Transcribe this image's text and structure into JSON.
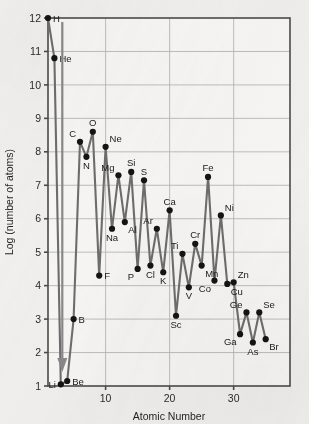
{
  "chart_data": {
    "type": "line",
    "title": "",
    "xlabel": "Atomic Number",
    "ylabel": "Log (number of atoms)",
    "xlim": [
      1,
      38.8
    ],
    "ylim": [
      1,
      12
    ],
    "grid": true,
    "legend": "none",
    "xticks": [
      10,
      20,
      30
    ],
    "yticks": [
      1,
      2,
      3,
      4,
      5,
      6,
      7,
      8,
      9,
      10,
      11,
      12
    ],
    "annotation": {
      "arrow_label": "Li",
      "arrow_note": "downward arrow at Li indicating value below axis range"
    },
    "point_labels": [
      "H",
      "He",
      "Li",
      "Be",
      "B",
      "C",
      "N",
      "O",
      "F",
      "Ne",
      "Na",
      "Mg",
      "Al",
      "Si",
      "P",
      "S",
      "Cl",
      "Ar",
      "K",
      "Ca",
      "Sc",
      "Ti",
      "V",
      "Cr",
      "Mn",
      "Fe",
      "Co",
      "Ni",
      "Cu",
      "Zn",
      "Ga",
      "Ge",
      "As",
      "Se",
      "Br"
    ],
    "x": [
      1,
      2,
      3,
      4,
      5,
      6,
      7,
      8,
      9,
      10,
      11,
      12,
      13,
      14,
      15,
      16,
      17,
      18,
      19,
      20,
      21,
      22,
      23,
      24,
      25,
      26,
      27,
      28,
      29,
      30,
      31,
      32,
      33,
      34,
      35
    ],
    "values": [
      12.0,
      10.8,
      1.05,
      1.15,
      3.0,
      8.3,
      7.85,
      8.6,
      4.3,
      8.15,
      5.7,
      7.3,
      5.9,
      7.4,
      4.5,
      7.15,
      4.6,
      5.7,
      4.4,
      6.25,
      3.1,
      4.95,
      3.95,
      5.25,
      4.6,
      7.25,
      4.15,
      6.1,
      4.05,
      4.1,
      2.55,
      3.2,
      2.3,
      3.2,
      2.4
    ],
    "label_offsets": {
      "H": "right",
      "He": "right",
      "Li": "left",
      "Be": "right",
      "B": "right",
      "C": "up-left",
      "N": "down",
      "O": "up",
      "F": "right",
      "Ne": "up-right",
      "Na": "down",
      "Mg": "up-left",
      "Al": "down-right",
      "Si": "up",
      "P": "down-left",
      "S": "up",
      "Cl": "down",
      "Ar": "up-left",
      "K": "down",
      "Ca": "up",
      "Sc": "down",
      "Ti": "up-left",
      "V": "down",
      "Cr": "up",
      "Mn": "down-right",
      "Fe": "up",
      "Co": "down-left",
      "Ni": "up-right",
      "Cu": "down-right",
      "Zn": "up-right",
      "Ga": "down-left",
      "Ge": "up-left",
      "As": "down",
      "Se": "up-right",
      "Br": "down-right"
    },
    "colors": {
      "line": "#6f6f6f",
      "marker": "#141414",
      "grid": "#b9b9b9",
      "axis": "#4b4b4b",
      "background": "#f3f2f0",
      "plot_background": "#faf9f8",
      "arrow": "#8a8a8a"
    }
  }
}
